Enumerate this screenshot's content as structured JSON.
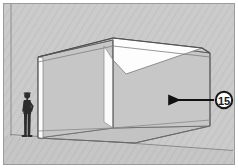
{
  "figure": {
    "type": "architectural-3d-sketch",
    "canvas": {
      "width": 238,
      "height": 168
    },
    "border": {
      "color": "#9a9a9a",
      "visible": true
    }
  },
  "background": {
    "color": "#c9c9c9",
    "hatch_color": "#bfbfbf",
    "hatch_style": "fine diagonal",
    "ground_color": "#c4c4c4"
  },
  "callout": {
    "number": "15",
    "circle_fill": "#ffffff",
    "circle_stroke": "#111111",
    "arrow_color": "#111111",
    "arrow_direction": "left",
    "target": "right-wall-panel",
    "cx": 224,
    "cy": 100,
    "r": 9,
    "arrow_from_x": 214,
    "arrow_to_x": 168,
    "arrow_y": 100
  },
  "geometry": {
    "description": "Open-top rectangular volume seen in three-point-ish perspective; two standing walls meet at an interior back corner, floor plane recedes to the right.",
    "line_color": "#5a5a5a",
    "line_color_light": "#8d8d8d",
    "wall_face_fill": "#c5c5c5",
    "white_panel_fill": "#fbfbfb",
    "roof_fill": "#ffffff",
    "vertices": {
      "top_left_front": "38,57",
      "top_back_apex": "113,38",
      "top_right_back": "202,48",
      "top_right_front": "210,53",
      "interior_corner_top": "113,40",
      "interior_corner_bottom": "113,128",
      "bottom_left_front": "38,138",
      "bottom_right_front": "210,126",
      "bottom_back": "135,143"
    }
  },
  "human_figure": {
    "label": "scale figure",
    "color": "#2b2b2b",
    "pose": "standing, hand on hip",
    "x": 27,
    "y_head": 92,
    "y_feet": 137
  },
  "ground_line": {
    "color": "#8d8d8d",
    "from": "10,134",
    "to": "232,150"
  },
  "left_margin_rule": {
    "color": "#8d8d8d",
    "x": 11
  }
}
